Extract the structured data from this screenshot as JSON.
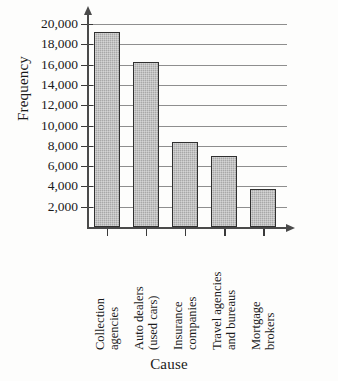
{
  "chart_data": {
    "type": "bar",
    "title": "",
    "xlabel": "Cause",
    "ylabel": "Frequency",
    "categories": [
      "Collection agencies",
      "Auto dealers (used cars)",
      "Insurance companies",
      "Travel agencies and bureaus",
      "Mortgage brokers"
    ],
    "category_lines": [
      [
        "Collection",
        "agencies"
      ],
      [
        "Auto dealers",
        "(used cars)"
      ],
      [
        "Insurance",
        "companies"
      ],
      [
        "Travel agencies",
        "and bureaus"
      ],
      [
        "Mortgage",
        "brokers"
      ]
    ],
    "values": [
      19200,
      16300,
      8400,
      7000,
      3700
    ],
    "ylim": [
      0,
      21000
    ],
    "ytick_values": [
      2000,
      4000,
      6000,
      8000,
      10000,
      12000,
      14000,
      16000,
      18000,
      20000
    ],
    "ytick_labels": [
      "2,000",
      "4,000",
      "6,000",
      "8,000",
      "10,000",
      "12,000",
      "14,000",
      "16,000",
      "18,000",
      "20,000"
    ],
    "grid": true,
    "grid_axis": "y",
    "legend": false,
    "bar_fill_color": "#a8a8a8",
    "bar_border_color": "#303030",
    "axis_color": "#4a4a4a",
    "grid_color": "#8e8e8e"
  }
}
